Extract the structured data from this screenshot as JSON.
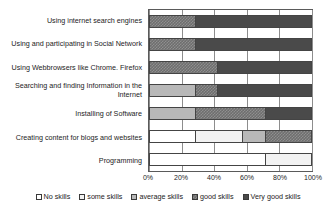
{
  "chart_data": {
    "type": "bar",
    "subtype": "stacked-horizontal-100-percent",
    "title": "",
    "xlabel": "",
    "ylabel": "",
    "xlim": [
      0,
      100
    ],
    "xticks": [
      "0%",
      "20%",
      "40%",
      "60%",
      "80%",
      "100%"
    ],
    "xtick_values": [
      0,
      20,
      40,
      60,
      80,
      100
    ],
    "grid": true,
    "legend_position": "bottom",
    "categories": [
      "Using internet search engines",
      "Using and participating in Social Network",
      "Using Webbrowsers like Chrome. Firefox",
      "Searching and finding Information in the Internet",
      "Installing of Software",
      "Creating content for blogs and websites",
      "Programming"
    ],
    "series": [
      {
        "name": "No skills",
        "key": "none",
        "color": "#ffffff",
        "values": [
          0,
          0,
          0,
          0,
          0,
          28,
          71
        ]
      },
      {
        "name": "some skills",
        "key": "some",
        "color": "#f2f2f2",
        "values": [
          0,
          0,
          0,
          0,
          0,
          29,
          29
        ]
      },
      {
        "name": "average skills",
        "key": "average",
        "color": "#b8b8b8",
        "values": [
          0,
          0,
          0,
          28,
          28,
          14,
          0
        ]
      },
      {
        "name": "good skills",
        "key": "good",
        "color": "#6e6e6e",
        "values": [
          28,
          28,
          42,
          14,
          43,
          29,
          0
        ]
      },
      {
        "name": "Very good skills",
        "key": "verygood",
        "color": "#4a4a4a",
        "values": [
          72,
          72,
          58,
          58,
          29,
          0,
          0
        ]
      }
    ]
  }
}
